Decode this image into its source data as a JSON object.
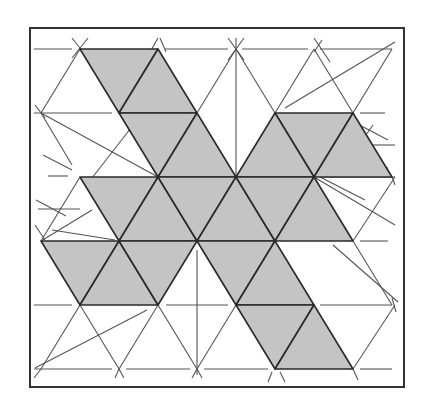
{
  "diagram": {
    "title": "",
    "frame": {
      "x": 30,
      "y": 28,
      "width": 374,
      "height": 359
    },
    "colors": {
      "shade": "#c4c4c4",
      "edge": "#2a2a2a",
      "thin_line": "#555555",
      "frame": "#333333",
      "background": "#ffffff"
    },
    "lattice": {
      "rows_y": [
        49,
        113,
        177,
        241,
        305,
        369
      ],
      "even_rows_x": [
        80,
        158,
        236,
        314,
        392
      ],
      "odd_rows_x": [
        41,
        119,
        197,
        275,
        353
      ]
    },
    "shaded_triangles": [
      [
        [
          80,
          49
        ],
        [
          158,
          49
        ],
        [
          119,
          113
        ]
      ],
      [
        [
          158,
          49
        ],
        [
          119,
          113
        ],
        [
          197,
          113
        ]
      ],
      [
        [
          119,
          113
        ],
        [
          197,
          113
        ],
        [
          158,
          177
        ]
      ],
      [
        [
          197,
          113
        ],
        [
          158,
          177
        ],
        [
          236,
          177
        ]
      ],
      [
        [
          275,
          113
        ],
        [
          353,
          113
        ],
        [
          314,
          177
        ]
      ],
      [
        [
          275,
          113
        ],
        [
          236,
          177
        ],
        [
          314,
          177
        ]
      ],
      [
        [
          353,
          113
        ],
        [
          314,
          177
        ],
        [
          392,
          177
        ]
      ],
      [
        [
          80,
          177
        ],
        [
          158,
          177
        ],
        [
          119,
          241
        ]
      ],
      [
        [
          158,
          177
        ],
        [
          119,
          241
        ],
        [
          197,
          241
        ]
      ],
      [
        [
          158,
          177
        ],
        [
          236,
          177
        ],
        [
          197,
          241
        ]
      ],
      [
        [
          236,
          177
        ],
        [
          197,
          241
        ],
        [
          275,
          241
        ]
      ],
      [
        [
          236,
          177
        ],
        [
          314,
          177
        ],
        [
          275,
          241
        ]
      ],
      [
        [
          314,
          177
        ],
        [
          275,
          241
        ],
        [
          353,
          241
        ]
      ],
      [
        [
          41,
          241
        ],
        [
          119,
          241
        ],
        [
          80,
          305
        ]
      ],
      [
        [
          119,
          241
        ],
        [
          80,
          305
        ],
        [
          158,
          305
        ]
      ],
      [
        [
          119,
          241
        ],
        [
          197,
          241
        ],
        [
          158,
          305
        ]
      ],
      [
        [
          197,
          241
        ],
        [
          275,
          241
        ],
        [
          236,
          305
        ]
      ],
      [
        [
          275,
          241
        ],
        [
          236,
          305
        ],
        [
          314,
          305
        ]
      ],
      [
        [
          236,
          305
        ],
        [
          314,
          305
        ],
        [
          275,
          369
        ]
      ],
      [
        [
          314,
          305
        ],
        [
          275,
          369
        ],
        [
          353,
          369
        ]
      ]
    ],
    "thin_lines": [
      [
        34,
        49,
        72,
        49
      ],
      [
        165,
        49,
        228,
        49
      ],
      [
        242,
        49,
        308,
        49
      ],
      [
        320,
        49,
        392,
        49
      ],
      [
        80,
        49,
        41,
        113
      ],
      [
        72,
        38,
        88,
        58
      ],
      [
        88,
        38,
        72,
        58
      ],
      [
        158,
        38,
        150,
        52
      ],
      [
        160,
        38,
        166,
        52
      ],
      [
        236,
        38,
        236,
        305
      ],
      [
        228,
        38,
        244,
        60
      ],
      [
        244,
        38,
        228,
        60
      ],
      [
        236,
        49,
        197,
        113
      ],
      [
        236,
        49,
        275,
        113
      ],
      [
        314,
        38,
        330,
        62
      ],
      [
        322,
        40,
        314,
        52
      ],
      [
        314,
        49,
        275,
        113
      ],
      [
        314,
        49,
        353,
        113
      ],
      [
        392,
        49,
        353,
        113
      ],
      [
        395,
        42,
        285,
        108
      ],
      [
        34,
        113,
        112,
        113
      ],
      [
        41,
        113,
        158,
        177
      ],
      [
        35,
        105,
        45,
        118
      ],
      [
        41,
        113,
        72,
        165
      ],
      [
        141,
        115,
        92,
        178
      ],
      [
        43,
        155,
        72,
        170
      ],
      [
        48,
        176,
        68,
        176
      ],
      [
        360,
        113,
        385,
        113
      ],
      [
        41,
        241,
        80,
        177
      ],
      [
        35,
        225,
        45,
        240
      ],
      [
        36,
        200,
        66,
        216
      ],
      [
        38,
        209,
        80,
        209
      ],
      [
        41,
        241,
        92,
        210
      ],
      [
        52,
        230,
        115,
        240
      ],
      [
        322,
        177,
        395,
        177
      ],
      [
        395,
        177,
        353,
        241
      ],
      [
        392,
        177,
        395,
        185
      ],
      [
        320,
        177,
        365,
        200
      ],
      [
        355,
        168,
        388,
        168
      ],
      [
        365,
        145,
        395,
        145
      ],
      [
        350,
        120,
        388,
        140
      ],
      [
        373,
        125,
        348,
        160
      ],
      [
        314,
        177,
        395,
        225
      ],
      [
        353,
        241,
        392,
        305
      ],
      [
        360,
        241,
        388,
        241
      ],
      [
        333,
        245,
        398,
        302
      ],
      [
        395,
        305,
        353,
        369
      ],
      [
        392,
        305,
        320,
        305
      ],
      [
        392,
        298,
        396,
        312
      ],
      [
        34,
        305,
        72,
        305
      ],
      [
        166,
        305,
        228,
        305
      ],
      [
        244,
        305,
        308,
        305
      ],
      [
        80,
        305,
        41,
        369
      ],
      [
        80,
        305,
        119,
        369
      ],
      [
        158,
        305,
        119,
        369
      ],
      [
        158,
        305,
        197,
        369
      ],
      [
        35,
        368,
        147,
        310
      ],
      [
        197,
        241,
        236,
        305
      ],
      [
        197,
        250,
        197,
        375
      ],
      [
        236,
        305,
        197,
        369
      ],
      [
        34,
        369,
        112,
        369
      ],
      [
        126,
        369,
        190,
        369
      ],
      [
        204,
        369,
        268,
        369
      ],
      [
        360,
        369,
        392,
        369
      ],
      [
        34,
        378,
        41,
        369
      ],
      [
        115,
        378,
        119,
        369
      ],
      [
        124,
        378,
        119,
        369
      ],
      [
        192,
        378,
        197,
        369
      ],
      [
        202,
        378,
        197,
        369
      ],
      [
        268,
        382,
        272,
        372
      ],
      [
        280,
        372,
        285,
        382
      ],
      [
        353,
        369,
        358,
        380
      ]
    ]
  }
}
